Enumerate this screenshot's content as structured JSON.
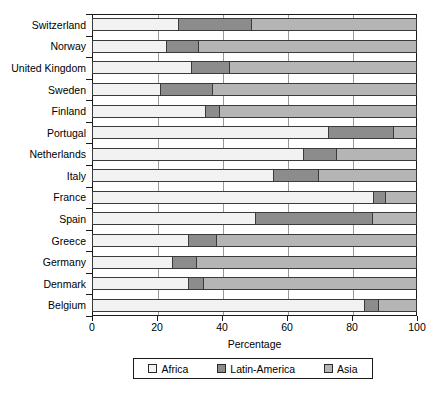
{
  "chart_data": {
    "type": "bar",
    "orientation": "horizontal",
    "stacked": true,
    "title": "",
    "xlabel": "Percentage",
    "ylabel": "",
    "xlim": [
      0,
      100
    ],
    "xticks": [
      0,
      20,
      40,
      60,
      80,
      100
    ],
    "xticklabels": [
      "0",
      "20",
      "40",
      "60",
      "80",
      "100"
    ],
    "grid": true,
    "legend_position": "bottom",
    "categories": [
      "Switzerland",
      "Norway",
      "United Kingdom",
      "Sweden",
      "Finland",
      "Portugal",
      "Netherlands",
      "Italy",
      "France",
      "Spain",
      "Greece",
      "Germany",
      "Denmark",
      "Belgium"
    ],
    "series": [
      {
        "name": "Africa",
        "color": "#f2f2f2",
        "values": [
          26.5,
          22.8,
          30.5,
          21.0,
          34.8,
          72.6,
          65.0,
          55.7,
          86.5,
          50.0,
          29.5,
          24.6,
          29.5,
          83.7
        ]
      },
      {
        "name": "Latin-America",
        "color": "#8c8c8c",
        "values": [
          22.5,
          9.8,
          11.5,
          16.0,
          4.2,
          20.0,
          10.0,
          13.8,
          3.5,
          36.0,
          8.5,
          7.4,
          4.5,
          4.3
        ]
      },
      {
        "name": "Asia",
        "color": "#b5b5b5",
        "values": [
          51.0,
          67.4,
          58.0,
          63.0,
          61.0,
          7.4,
          25.0,
          30.5,
          10.0,
          14.0,
          62.0,
          68.0,
          66.0,
          12.0
        ]
      }
    ]
  },
  "legend": {
    "items": [
      {
        "label": "Africa",
        "color": "#f2f2f2"
      },
      {
        "label": "Latin-America",
        "color": "#8c8c8c"
      },
      {
        "label": "Asia",
        "color": "#b5b5b5"
      }
    ]
  },
  "axis": {
    "x_title": "Percentage"
  }
}
